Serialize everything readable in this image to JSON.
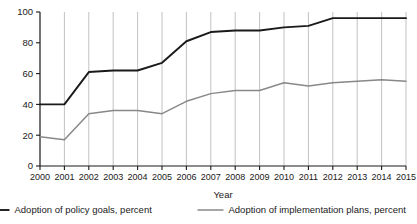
{
  "chart_data": {
    "type": "line",
    "title": "",
    "xlabel": "Year",
    "ylabel": "",
    "grid": "vertical",
    "legend_position": "bottom",
    "xlim": [
      2000,
      2015
    ],
    "ylim": [
      0,
      100
    ],
    "ytick_labels": [
      "0",
      "20",
      "40",
      "60",
      "80",
      "100"
    ],
    "yticks": [
      0,
      20,
      40,
      60,
      80,
      100
    ],
    "categories": [
      2000,
      2001,
      2002,
      2003,
      2004,
      2005,
      2006,
      2007,
      2008,
      2009,
      2010,
      2011,
      2012,
      2013,
      2014,
      2015
    ],
    "xtick_labels": [
      "2000",
      "2001",
      "2002",
      "2003",
      "2004",
      "2005",
      "2006",
      "2007",
      "2008",
      "2009",
      "2010",
      "2011",
      "2012",
      "2013",
      "2014",
      "2015"
    ],
    "series": [
      {
        "name": "Adoption of policy goals, percent",
        "color": "#1a1a1a",
        "width": 1.9,
        "values": [
          40,
          40,
          61,
          62,
          62,
          67,
          81,
          87,
          88,
          88,
          90,
          91,
          96,
          96,
          96,
          96
        ]
      },
      {
        "name": "Adoption of implementation plans, percent",
        "color": "#888888",
        "width": 1.5,
        "values": [
          19,
          17,
          34,
          36,
          36,
          34,
          42,
          47,
          49,
          49,
          54,
          52,
          54,
          55,
          56,
          55
        ]
      }
    ]
  },
  "axis": {
    "x_title": "Year"
  },
  "legend": {
    "items": [
      {
        "label": "Adoption of policy goals, percent",
        "color": "#1a1a1a"
      },
      {
        "label": "Adoption of implementation plans, percent",
        "color": "#888888"
      }
    ]
  }
}
